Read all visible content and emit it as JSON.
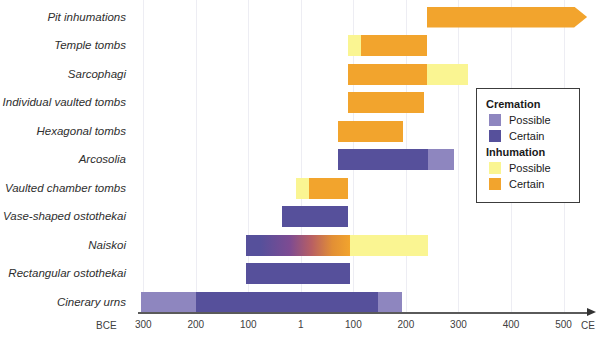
{
  "colors": {
    "cremation_possible": "#8e86bf",
    "cremation_certain": "#56509b",
    "inhumation_possible": "#faf592",
    "inhumation_certain": "#f2a42d",
    "naiskoi_gradient_stops": [
      "#56509b",
      "#7d4b92",
      "#b85f63",
      "#e28f35",
      "#f2a42d"
    ],
    "gridline": "#ededf3",
    "axis_line": "#5a5a5a"
  },
  "axis": {
    "era_left": "BCE",
    "era_right": "CE",
    "ticks": [
      {
        "label": "300",
        "year": -300
      },
      {
        "label": "200",
        "year": -200
      },
      {
        "label": "100",
        "year": -100
      },
      {
        "label": "1",
        "year": 0
      },
      {
        "label": "100",
        "year": 100
      },
      {
        "label": "200",
        "year": 200
      },
      {
        "label": "300",
        "year": 300
      },
      {
        "label": "400",
        "year": 400
      },
      {
        "label": "500",
        "year": 500
      }
    ]
  },
  "legend": {
    "sections": [
      {
        "title": "Cremation",
        "items": [
          {
            "label": "Possible",
            "color": "cremation_possible"
          },
          {
            "label": "Certain",
            "color": "cremation_certain"
          }
        ]
      },
      {
        "title": "Inhumation",
        "items": [
          {
            "label": "Possible",
            "color": "inhumation_possible"
          },
          {
            "label": "Certain",
            "color": "inhumation_certain"
          }
        ]
      }
    ]
  },
  "chart_data": {
    "type": "bar",
    "subtype": "horizontal-timeline",
    "title": "",
    "xlabel": "Years (BCE / CE)",
    "unit": "years, negative = BCE",
    "xlim": [
      -310,
      579
    ],
    "x_ticks": [
      -300,
      -200,
      -100,
      1,
      100,
      200,
      300,
      400,
      500
    ],
    "grid": true,
    "legend_position": "right-inside",
    "categories": [
      "Pit inhumations",
      "Temple tombs",
      "Sarcophagi",
      "Individual vaulted tombs",
      "Hexagonal tombs",
      "Arcosolia",
      "Vaulted chamber tombs",
      "Vase-shaped ostothekai",
      "Naiskoi",
      "Rectangular ostothekai",
      "Cinerary urns"
    ],
    "rows": [
      {
        "category": "Pit inhumations",
        "segments": [
          {
            "kind": "inhumation_certain",
            "start": 240,
            "end": 545,
            "arrow": true,
            "note": "continues beyond chart"
          }
        ]
      },
      {
        "category": "Temple tombs",
        "segments": [
          {
            "kind": "inhumation_possible",
            "start": 90,
            "end": 115
          },
          {
            "kind": "inhumation_certain",
            "start": 115,
            "end": 240
          }
        ]
      },
      {
        "category": "Sarcophagi",
        "segments": [
          {
            "kind": "inhumation_certain",
            "start": 90,
            "end": 240
          },
          {
            "kind": "inhumation_possible",
            "start": 240,
            "end": 318
          }
        ]
      },
      {
        "category": "Individual vaulted tombs",
        "segments": [
          {
            "kind": "inhumation_certain",
            "start": 90,
            "end": 235
          }
        ]
      },
      {
        "category": "Hexagonal tombs",
        "segments": [
          {
            "kind": "inhumation_certain",
            "start": 70,
            "end": 195
          }
        ]
      },
      {
        "category": "Arcosolia",
        "segments": [
          {
            "kind": "cremation_certain",
            "start": 70,
            "end": 242
          },
          {
            "kind": "cremation_possible",
            "start": 242,
            "end": 292
          }
        ]
      },
      {
        "category": "Vaulted chamber tombs",
        "segments": [
          {
            "kind": "inhumation_possible",
            "start": -10,
            "end": 15
          },
          {
            "kind": "inhumation_certain",
            "start": 15,
            "end": 90
          }
        ]
      },
      {
        "category": "Vase-shaped ostothekai",
        "segments": [
          {
            "kind": "cremation_certain",
            "start": -35,
            "end": 90
          }
        ]
      },
      {
        "category": "Naiskoi",
        "segments": [
          {
            "kind": "cremation_to_inhumation_gradient",
            "start": -105,
            "end": 93
          },
          {
            "kind": "inhumation_possible",
            "start": 93,
            "end": 242
          }
        ]
      },
      {
        "category": "Rectangular ostothekai",
        "segments": [
          {
            "kind": "cremation_certain",
            "start": -105,
            "end": 93
          }
        ]
      },
      {
        "category": "Cinerary urns",
        "segments": [
          {
            "kind": "cremation_possible",
            "start": -305,
            "end": -200
          },
          {
            "kind": "cremation_certain",
            "start": -200,
            "end": 147
          },
          {
            "kind": "cremation_possible",
            "start": 147,
            "end": 192
          }
        ]
      }
    ]
  }
}
